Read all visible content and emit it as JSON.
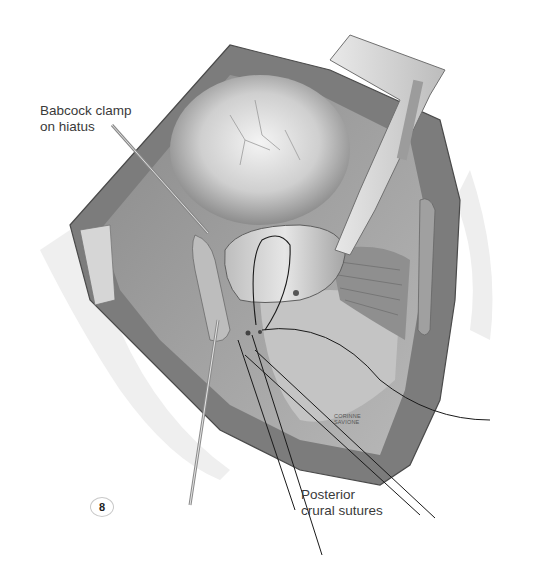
{
  "figure": {
    "number": "8",
    "style": "grayscale surgical illustration",
    "colors": {
      "background": "#ffffff",
      "tissue_dark": "#6e6e6e",
      "tissue_mid": "#a9a9a9",
      "tissue_light": "#d9d9d9",
      "label_text": "#3a3a3a",
      "suture": "#1a1a1a"
    }
  },
  "labels": {
    "babcock": {
      "line1": "Babcock clamp",
      "line2": "on hiatus"
    },
    "posterior": {
      "line1": "Posterior",
      "line2": "crural sutures"
    }
  },
  "signature": {
    "line1": "CORINNE",
    "line2": "SAVIONE"
  }
}
